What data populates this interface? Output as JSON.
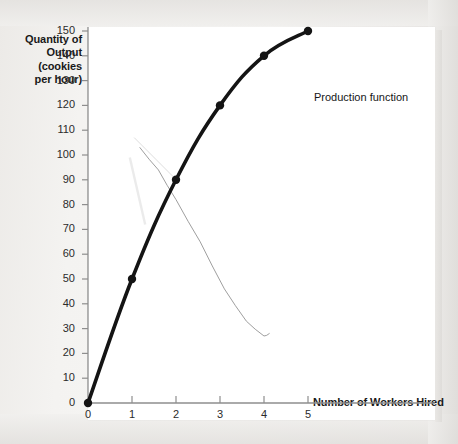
{
  "chart_data": {
    "type": "line",
    "title": "",
    "xlabel": "Number of Workers Hired",
    "ylabel": "Quantity of Output (cookies per hour)",
    "ylabel_lines": [
      "Quantity of",
      "Output",
      "(cookies",
      "per hour)"
    ],
    "xlim": [
      0,
      5
    ],
    "ylim": [
      0,
      150
    ],
    "grid": false,
    "legend_position": "inline-right-of-last-point",
    "x": [
      0,
      1,
      2,
      3,
      4,
      5
    ],
    "xtick_labels": [
      "0",
      "1",
      "2",
      "3",
      "4",
      "5"
    ],
    "ytick_labels": [
      "0",
      "10",
      "20",
      "30",
      "40",
      "50",
      "60",
      "70",
      "80",
      "90",
      "100",
      "110",
      "120",
      "130",
      "140",
      "150"
    ],
    "ytick_values": [
      0,
      10,
      20,
      30,
      40,
      50,
      60,
      70,
      80,
      90,
      100,
      110,
      120,
      130,
      140,
      150
    ],
    "series": [
      {
        "name": "Production function",
        "values": [
          0,
          50,
          90,
          120,
          140,
          150
        ],
        "color": "#141414",
        "line_width": 3.6,
        "marker": "circle",
        "marker_size": 4.2,
        "annotation": "Production function"
      },
      {
        "name": "marginal-product-pencil-overlay",
        "color": "#8d8d8d",
        "line_width": 0.9,
        "marker": "none",
        "hand_drawn": true,
        "x": [
          1.18,
          1.6,
          2.0,
          2.55,
          3.1,
          3.6,
          4.0,
          4.12
        ],
        "values": [
          103,
          94,
          82,
          65,
          46,
          33,
          27,
          28
        ]
      }
    ],
    "annotations": [
      {
        "text": "Production function",
        "x": 5,
        "y": 150,
        "placement": "right"
      }
    ]
  },
  "axes": {
    "y_title": "Quantity of\nOutput\n(cookies\nper hour)",
    "x_title": "Number of Workers Hired",
    "axis_color": "#8e8e8e",
    "tick_color": "#8e8e8e",
    "label_color": "#2b2b2b"
  },
  "colors": {
    "page_background": "#f2f1ef",
    "plot_background": "#ffffff",
    "series_primary": "#141414",
    "series_overlay": "#8d8d8d",
    "axis": "#8e8e8e",
    "text": "#191919"
  }
}
